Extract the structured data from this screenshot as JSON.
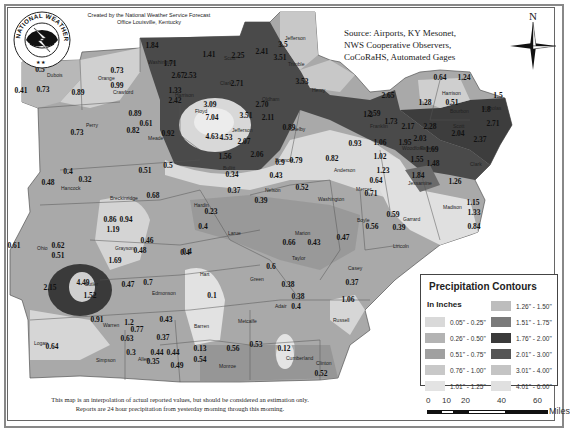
{
  "header": {
    "credit_line1": "Created by the National Weather Service Forecast",
    "credit_line2": "Office Louisville, Kentucky",
    "logo_text": "NATIONAL WEATHER SERVICE",
    "source_line1": "Source: Airports, KY Mesonet,",
    "source_line2": "NWS Cooperative Observers,",
    "source_line3": "CoCoRaHS, Automated Gages",
    "compass_label": "N"
  },
  "footer": {
    "disclaimer_line1": "This map is an interpolation of actual reported values, but should be considered an estimation only.",
    "disclaimer_line2": "Reports are 24 hour precipitation from yesterday morning through this morning."
  },
  "legend": {
    "title": "Precipitation Contours",
    "subtitle": "In Inches",
    "items": [
      {
        "label": "0.05\" - 0.25\"",
        "color": "#d9d9d9"
      },
      {
        "label": "0.26\" - 0.50\"",
        "color": "#b3b3b3"
      },
      {
        "label": "0.51\" - 0.75\"",
        "color": "#a0a0a0"
      },
      {
        "label": "0.76\" - 1.00\"",
        "color": "#c8c8c8"
      },
      {
        "label": "1.01\" - 1.25\"",
        "color": "#e3e3e3"
      },
      {
        "label": "1.26\" - 1.50\"",
        "color": "#bdbdbd"
      },
      {
        "label": "1.51\" - 1.75\"",
        "color": "#7a7a7a"
      },
      {
        "label": "1.76\" - 2.00\"",
        "color": "#3a3a3a"
      },
      {
        "label": "2.01\" - 3.00\"",
        "color": "#555555"
      },
      {
        "label": "3.01\" - 4.00\"",
        "color": "#c4c4c4"
      },
      {
        "label": "4.01\" - 6.00\"",
        "color": "#e0e0e0"
      }
    ]
  },
  "scale_bar": {
    "ticks": [
      "0",
      "10",
      "20",
      "40",
      "60"
    ],
    "unit": "Miles"
  },
  "counties": [
    {
      "name": "Orange",
      "x": 98,
      "y": 80
    },
    {
      "name": "Washington",
      "x": 148,
      "y": 64
    },
    {
      "name": "Scott",
      "x": 224,
      "y": 60
    },
    {
      "name": "Jefferson",
      "x": 285,
      "y": 40
    },
    {
      "name": "Trimble",
      "x": 288,
      "y": 66
    },
    {
      "name": "Henry",
      "x": 312,
      "y": 92
    },
    {
      "name": "Clark",
      "x": 220,
      "y": 85
    },
    {
      "name": "Floyd",
      "x": 195,
      "y": 113
    },
    {
      "name": "Oldham",
      "x": 262,
      "y": 101
    },
    {
      "name": "Jefferson",
      "x": 232,
      "y": 132
    },
    {
      "name": "Dubois",
      "x": 47,
      "y": 77
    },
    {
      "name": "Crawford",
      "x": 113,
      "y": 94
    },
    {
      "name": "Harrison",
      "x": 175,
      "y": 97
    },
    {
      "name": "Perry",
      "x": 86,
      "y": 127
    },
    {
      "name": "Meade",
      "x": 148,
      "y": 140
    },
    {
      "name": "Hancock",
      "x": 61,
      "y": 190
    },
    {
      "name": "Breckinridge",
      "x": 110,
      "y": 200
    },
    {
      "name": "Shelby",
      "x": 290,
      "y": 131
    },
    {
      "name": "Franklin",
      "x": 370,
      "y": 128
    },
    {
      "name": "Spencer",
      "x": 275,
      "y": 162
    },
    {
      "name": "Bullitt",
      "x": 223,
      "y": 170
    },
    {
      "name": "Anderson",
      "x": 334,
      "y": 172
    },
    {
      "name": "Woodford",
      "x": 402,
      "y": 150
    },
    {
      "name": "Harrison",
      "x": 442,
      "y": 95
    },
    {
      "name": "Nicholas",
      "x": 482,
      "y": 110
    },
    {
      "name": "Scott",
      "x": 453,
      "y": 128
    },
    {
      "name": "Fayette",
      "x": 420,
      "y": 150
    },
    {
      "name": "Bourbon",
      "x": 450,
      "y": 113
    },
    {
      "name": "Clark",
      "x": 470,
      "y": 166
    },
    {
      "name": "Jessamine",
      "x": 408,
      "y": 185
    },
    {
      "name": "Madison",
      "x": 443,
      "y": 209
    },
    {
      "name": "Mercer",
      "x": 356,
      "y": 191
    },
    {
      "name": "Boyle",
      "x": 357,
      "y": 222
    },
    {
      "name": "Garrard",
      "x": 403,
      "y": 221
    },
    {
      "name": "Lincoln",
      "x": 393,
      "y": 248
    },
    {
      "name": "Nelson",
      "x": 265,
      "y": 192
    },
    {
      "name": "Washington",
      "x": 318,
      "y": 201
    },
    {
      "name": "Hardin",
      "x": 194,
      "y": 207
    },
    {
      "name": "Larue",
      "x": 228,
      "y": 235
    },
    {
      "name": "Marion",
      "x": 295,
      "y": 235
    },
    {
      "name": "Taylor",
      "x": 292,
      "y": 260
    },
    {
      "name": "Casey",
      "x": 348,
      "y": 270
    },
    {
      "name": "Green",
      "x": 250,
      "y": 281
    },
    {
      "name": "Hart",
      "x": 200,
      "y": 276
    },
    {
      "name": "Adair",
      "x": 275,
      "y": 308
    },
    {
      "name": "Russell",
      "x": 333,
      "y": 322
    },
    {
      "name": "Ohio",
      "x": 37,
      "y": 250
    },
    {
      "name": "Grayson",
      "x": 115,
      "y": 250
    },
    {
      "name": "Butler",
      "x": 85,
      "y": 286
    },
    {
      "name": "Edmonson",
      "x": 152,
      "y": 295
    },
    {
      "name": "Warren",
      "x": 103,
      "y": 327
    },
    {
      "name": "Barren",
      "x": 194,
      "y": 328
    },
    {
      "name": "Metcalfe",
      "x": 238,
      "y": 323
    },
    {
      "name": "Logan",
      "x": 34,
      "y": 345
    },
    {
      "name": "Simpson",
      "x": 96,
      "y": 362
    },
    {
      "name": "Allen",
      "x": 138,
      "y": 361
    },
    {
      "name": "Monroe",
      "x": 219,
      "y": 368
    },
    {
      "name": "Cumberland",
      "x": 286,
      "y": 360
    },
    {
      "name": "Clinton",
      "x": 316,
      "y": 365
    }
  ],
  "readings": [
    {
      "v": "0.73",
      "x": 117,
      "y": 73
    },
    {
      "v": "0.99",
      "x": 117,
      "y": 88
    },
    {
      "v": "1.84",
      "x": 152,
      "y": 48
    },
    {
      "v": "1.71",
      "x": 170,
      "y": 66
    },
    {
      "v": "2.67",
      "x": 178,
      "y": 78
    },
    {
      "v": "2.53",
      "x": 190,
      "y": 78
    },
    {
      "v": "1.33",
      "x": 175,
      "y": 93
    },
    {
      "v": "2.42",
      "x": 175,
      "y": 103
    },
    {
      "v": "1.41",
      "x": 209,
      "y": 57
    },
    {
      "v": "2.25",
      "x": 238,
      "y": 58
    },
    {
      "v": "2.41",
      "x": 262,
      "y": 54
    },
    {
      "v": "3.5",
      "x": 283,
      "y": 47
    },
    {
      "v": "3.51",
      "x": 280,
      "y": 60
    },
    {
      "v": "3.53",
      "x": 302,
      "y": 84
    },
    {
      "v": "2.71",
      "x": 237,
      "y": 86
    },
    {
      "v": "3.09",
      "x": 210,
      "y": 107
    },
    {
      "v": "7.04",
      "x": 212,
      "y": 120
    },
    {
      "v": "3.51",
      "x": 246,
      "y": 118
    },
    {
      "v": "2.11",
      "x": 268,
      "y": 120
    },
    {
      "v": "2.70",
      "x": 262,
      "y": 107
    },
    {
      "v": "4.63",
      "x": 212,
      "y": 139
    },
    {
      "v": "4.53",
      "x": 226,
      "y": 140
    },
    {
      "v": "2.07",
      "x": 244,
      "y": 144
    },
    {
      "v": "1.56",
      "x": 225,
      "y": 159
    },
    {
      "v": "2.06",
      "x": 257,
      "y": 157
    },
    {
      "v": "0.89",
      "x": 289,
      "y": 130
    },
    {
      "v": "1.2",
      "x": 368,
      "y": 117
    },
    {
      "v": "2.65",
      "x": 388,
      "y": 98
    },
    {
      "v": "0.5",
      "x": 40,
      "y": 72
    },
    {
      "v": "0.89",
      "x": 78,
      "y": 95
    },
    {
      "v": "0.41",
      "x": 21,
      "y": 93
    },
    {
      "v": "0.73",
      "x": 43,
      "y": 92
    },
    {
      "v": "0.89",
      "x": 135,
      "y": 116
    },
    {
      "v": "0.61",
      "x": 146,
      "y": 126
    },
    {
      "v": "0.82",
      "x": 133,
      "y": 133
    },
    {
      "v": "0.92",
      "x": 168,
      "y": 136
    },
    {
      "v": "0.73",
      "x": 77,
      "y": 135
    },
    {
      "v": "0.5",
      "x": 168,
      "y": 168
    },
    {
      "v": "0.34",
      "x": 232,
      "y": 177
    },
    {
      "v": "0.9",
      "x": 280,
      "y": 165
    },
    {
      "v": "0.79",
      "x": 296,
      "y": 163
    },
    {
      "v": "0.43",
      "x": 276,
      "y": 178
    },
    {
      "v": "0.82",
      "x": 332,
      "y": 161
    },
    {
      "v": "0.93",
      "x": 355,
      "y": 146
    },
    {
      "v": "0.64",
      "x": 376,
      "y": 183
    },
    {
      "v": "0.71",
      "x": 371,
      "y": 196
    },
    {
      "v": "1.06",
      "x": 380,
      "y": 145
    },
    {
      "v": "1.02",
      "x": 380,
      "y": 159
    },
    {
      "v": "1.23",
      "x": 383,
      "y": 173
    },
    {
      "v": "0.64",
      "x": 440,
      "y": 80
    },
    {
      "v": "1.24",
      "x": 464,
      "y": 80
    },
    {
      "v": "1.28",
      "x": 425,
      "y": 105
    },
    {
      "v": "0.51",
      "x": 452,
      "y": 105
    },
    {
      "v": "1.5",
      "x": 498,
      "y": 98
    },
    {
      "v": "1.8",
      "x": 486,
      "y": 112
    },
    {
      "v": "2.59",
      "x": 374,
      "y": 116
    },
    {
      "v": "1.73",
      "x": 391,
      "y": 124
    },
    {
      "v": "2.17",
      "x": 408,
      "y": 129
    },
    {
      "v": "2.28",
      "x": 430,
      "y": 129
    },
    {
      "v": "2.04",
      "x": 458,
      "y": 136
    },
    {
      "v": "2.71",
      "x": 493,
      "y": 126
    },
    {
      "v": "2.37",
      "x": 480,
      "y": 142
    },
    {
      "v": "1.95",
      "x": 405,
      "y": 145
    },
    {
      "v": "2.03",
      "x": 420,
      "y": 141
    },
    {
      "v": "1.69",
      "x": 432,
      "y": 152
    },
    {
      "v": "1.55",
      "x": 417,
      "y": 162
    },
    {
      "v": "1.48",
      "x": 433,
      "y": 166
    },
    {
      "v": "1.84",
      "x": 418,
      "y": 178
    },
    {
      "v": "1.26",
      "x": 455,
      "y": 184
    },
    {
      "v": "1.15",
      "x": 473,
      "y": 205
    },
    {
      "v": "1.33",
      "x": 474,
      "y": 215
    },
    {
      "v": "0.84",
      "x": 474,
      "y": 229
    },
    {
      "v": "0.59",
      "x": 393,
      "y": 217
    },
    {
      "v": "0.56",
      "x": 372,
      "y": 229
    },
    {
      "v": "0.39",
      "x": 399,
      "y": 230
    },
    {
      "v": "0.47",
      "x": 343,
      "y": 240
    },
    {
      "v": "0.4",
      "x": 68,
      "y": 174
    },
    {
      "v": "0.32",
      "x": 85,
      "y": 182
    },
    {
      "v": "0.48",
      "x": 48,
      "y": 185
    },
    {
      "v": "0.51",
      "x": 145,
      "y": 173
    },
    {
      "v": "0.68",
      "x": 153,
      "y": 198
    },
    {
      "v": "0.86",
      "x": 110,
      "y": 222
    },
    {
      "v": "0.94",
      "x": 126,
      "y": 222
    },
    {
      "v": "1.19",
      "x": 113,
      "y": 232
    },
    {
      "v": "0.61",
      "x": 14,
      "y": 248
    },
    {
      "v": "0.62",
      "x": 58,
      "y": 248
    },
    {
      "v": "0.51",
      "x": 58,
      "y": 258
    },
    {
      "v": "0.46",
      "x": 147,
      "y": 243
    },
    {
      "v": "0.48",
      "x": 140,
      "y": 253
    },
    {
      "v": "0.4",
      "x": 185,
      "y": 255
    },
    {
      "v": "1.69",
      "x": 115,
      "y": 263
    },
    {
      "v": "0.52",
      "x": 302,
      "y": 190
    },
    {
      "v": "0.37",
      "x": 234,
      "y": 193
    },
    {
      "v": "0.39",
      "x": 261,
      "y": 203
    },
    {
      "v": "0.23",
      "x": 211,
      "y": 214
    },
    {
      "v": "0.4",
      "x": 203,
      "y": 229
    },
    {
      "v": "0.4",
      "x": 187,
      "y": 254
    },
    {
      "v": "0.66",
      "x": 289,
      "y": 245
    },
    {
      "v": "0.43",
      "x": 314,
      "y": 245
    },
    {
      "v": "0.6",
      "x": 271,
      "y": 269
    },
    {
      "v": "0.38",
      "x": 288,
      "y": 287
    },
    {
      "v": "0.37",
      "x": 352,
      "y": 285
    },
    {
      "v": "0.38",
      "x": 298,
      "y": 299
    },
    {
      "v": "0.4",
      "x": 296,
      "y": 309
    },
    {
      "v": "1.06",
      "x": 348,
      "y": 302
    },
    {
      "v": "0.1",
      "x": 212,
      "y": 298
    },
    {
      "v": "4.49",
      "x": 83,
      "y": 285
    },
    {
      "v": "1.52",
      "x": 90,
      "y": 298
    },
    {
      "v": "2.15",
      "x": 50,
      "y": 290
    },
    {
      "v": "0.47",
      "x": 128,
      "y": 287
    },
    {
      "v": "0.7",
      "x": 148,
      "y": 285
    },
    {
      "v": "0.91",
      "x": 97,
      "y": 322
    },
    {
      "v": "1.2",
      "x": 129,
      "y": 325
    },
    {
      "v": "0.77",
      "x": 137,
      "y": 332
    },
    {
      "v": "0.63",
      "x": 127,
      "y": 341
    },
    {
      "v": "0.43",
      "x": 166,
      "y": 322
    },
    {
      "v": "0.37",
      "x": 163,
      "y": 340
    },
    {
      "v": "0.64",
      "x": 52,
      "y": 349
    },
    {
      "v": "0.3",
      "x": 131,
      "y": 355
    },
    {
      "v": "0.44",
      "x": 157,
      "y": 355
    },
    {
      "v": "0.44",
      "x": 173,
      "y": 355
    },
    {
      "v": "0.35",
      "x": 153,
      "y": 364
    },
    {
      "v": "0.49",
      "x": 177,
      "y": 368
    },
    {
      "v": "0.13",
      "x": 200,
      "y": 351
    },
    {
      "v": "0.54",
      "x": 200,
      "y": 362
    },
    {
      "v": "0.56",
      "x": 233,
      "y": 351
    },
    {
      "v": "0.53",
      "x": 256,
      "y": 347
    },
    {
      "v": "0.12",
      "x": 284,
      "y": 351
    },
    {
      "v": "0.52",
      "x": 321,
      "y": 376
    }
  ]
}
